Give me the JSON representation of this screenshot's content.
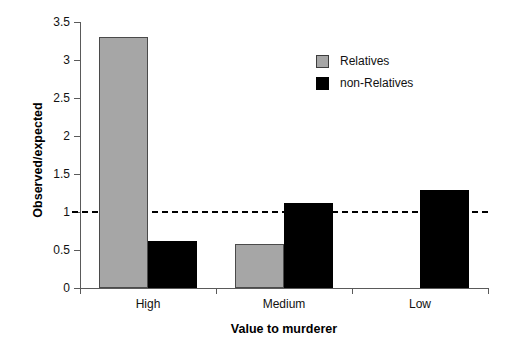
{
  "chart_data": {
    "type": "bar",
    "title": "",
    "subtitle": "",
    "xlabel": "Value to murderer",
    "ylabel": "Observed/expected",
    "categories": [
      "High",
      "Medium",
      "Low"
    ],
    "series": [
      {
        "name": "Relatives",
        "color": "#a6a6a6",
        "values": [
          3.3,
          0.58,
          null
        ]
      },
      {
        "name": "non-Relatives",
        "color": "#000000",
        "values": [
          0.62,
          1.12,
          1.29
        ]
      }
    ],
    "ylim": [
      0,
      3.5
    ],
    "yticks": [
      "0",
      "0.5",
      "1",
      "1.5",
      "2",
      "2.5",
      "3",
      "3.5"
    ],
    "ytick_values": [
      0,
      0.5,
      1,
      1.5,
      2,
      2.5,
      3,
      3.5
    ],
    "grid": false,
    "legend_position": "top-right",
    "annotations": [
      {
        "type": "hline",
        "value": 1,
        "style": "dashed",
        "color": "#000000"
      }
    ]
  },
  "legend": {
    "items": [
      {
        "label": "Relatives",
        "color": "#a6a6a6"
      },
      {
        "label": "non-Relatives",
        "color": "#000000"
      }
    ]
  },
  "axes": {
    "y_label": "Observed/expected",
    "x_label": "Value to murderer"
  }
}
